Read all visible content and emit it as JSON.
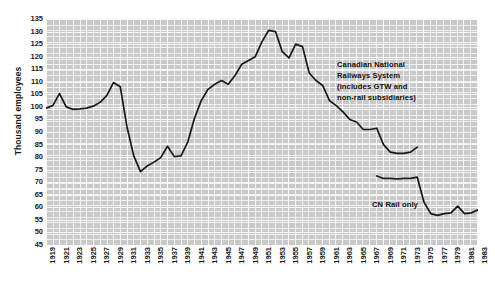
{
  "axes": {
    "ylabel": "Thousand employees",
    "y_ticks": [
      135,
      130,
      125,
      120,
      115,
      110,
      105,
      100,
      95,
      90,
      85,
      80,
      75,
      70,
      65,
      60,
      55,
      50,
      45
    ],
    "x_ticks": [
      1919,
      1921,
      1923,
      1925,
      1927,
      1929,
      1931,
      1933,
      1935,
      1937,
      1939,
      1941,
      1943,
      1945,
      1947,
      1949,
      1951,
      1953,
      1955,
      1957,
      1959,
      1961,
      1963,
      1965,
      1967,
      1969,
      1971,
      1973,
      1975,
      1977,
      1979,
      1981,
      1983
    ]
  },
  "annotations": {
    "system": "Canadian National\nRailways System\n(includes GTW and\nnon-rail subsidiaries)",
    "cnrail": "CN Rail only"
  },
  "colors": {
    "plot_background": "#c9c9c9",
    "grid_minor": "#f2f2f2",
    "grid_major": "#fafafa",
    "line": "#1a1a1a",
    "text": "#1a1a1a"
  },
  "chart_data": {
    "type": "line",
    "title": "",
    "xlabel": "",
    "ylabel": "Thousand employees",
    "xlim": [
      1919,
      1983
    ],
    "ylim": [
      45,
      135
    ],
    "grid": true,
    "legend": "annotations-inline",
    "series": [
      {
        "name": "Canadian National Railways System (includes GTW and non-rail subsidiaries)",
        "x": [
          1919,
          1920,
          1921,
          1922,
          1923,
          1924,
          1925,
          1926,
          1927,
          1928,
          1929,
          1930,
          1931,
          1932,
          1933,
          1934,
          1935,
          1936,
          1937,
          1938,
          1939,
          1940,
          1941,
          1942,
          1943,
          1944,
          1945,
          1946,
          1947,
          1948,
          1949,
          1950,
          1951,
          1952,
          1953,
          1954,
          1955,
          1956,
          1957,
          1958,
          1959,
          1960,
          1961,
          1962,
          1963,
          1964,
          1965,
          1966,
          1967,
          1968,
          1969,
          1970,
          1971,
          1972,
          1973,
          1974
        ],
        "values": [
          99.5,
          100.5,
          105.3,
          100.0,
          99.0,
          99.2,
          99.5,
          100.3,
          101.8,
          104.5,
          109.7,
          108.0,
          92.0,
          80.5,
          74.2,
          76.5,
          78.0,
          79.8,
          84.3,
          80.2,
          80.5,
          86.0,
          95.5,
          102.5,
          107.0,
          109.0,
          110.5,
          109.0,
          112.5,
          117.0,
          118.5,
          120.0,
          126.0,
          130.5,
          130.0,
          122.0,
          119.5,
          125.0,
          124.0,
          113.5,
          110.5,
          108.5,
          102.5,
          100.5,
          98.0,
          95.0,
          94.0,
          91.0,
          91.0,
          91.5,
          85.0,
          82.0,
          81.5,
          81.5,
          82.0,
          84.0
        ]
      },
      {
        "name": "CN Rail only",
        "x": [
          1968,
          1969,
          1970,
          1971,
          1972,
          1973,
          1974,
          1975,
          1976,
          1977,
          1978,
          1979,
          1980,
          1981,
          1982,
          1983
        ],
        "values": [
          72.5,
          71.5,
          71.5,
          71.3,
          71.5,
          71.5,
          72.0,
          62.0,
          57.5,
          56.8,
          57.5,
          57.8,
          60.5,
          57.5,
          57.8,
          59.0
        ]
      }
    ]
  }
}
